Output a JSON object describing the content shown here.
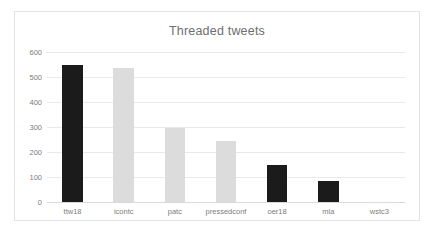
{
  "chart_data": {
    "type": "bar",
    "title": "Threaded tweets",
    "xlabel": "",
    "ylabel": "",
    "ylim": [
      0,
      600
    ],
    "yticks": [
      0,
      100,
      200,
      300,
      400,
      500,
      600
    ],
    "ytick_labels": [
      "0",
      "100",
      "200",
      "300",
      "400",
      "500",
      "600"
    ],
    "grid": true,
    "legend": false,
    "categories": [
      "ttw18",
      "icontc",
      "patc",
      "pressedconf",
      "oer18",
      "mla",
      "wstc3"
    ],
    "values": [
      548,
      535,
      298,
      245,
      150,
      85,
      2
    ],
    "bar_colors": [
      "#1b1b1b",
      "#dcdcdc",
      "#dcdcdc",
      "#dcdcdc",
      "#1b1b1b",
      "#1b1b1b",
      "#dcdcdc"
    ],
    "colors": {
      "dark_bar": "#1b1b1b",
      "light_bar": "#dcdcdc",
      "gridline": "#e9e9e9",
      "axis_line": "#d9d9d9",
      "text": "#7d7d7d",
      "title_text": "#6e6e6e",
      "frame_border": "#e3e3e3",
      "background": "#ffffff"
    }
  }
}
